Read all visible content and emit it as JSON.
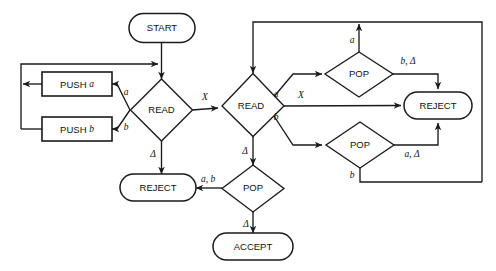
{
  "diagram": {
    "type": "flowchart",
    "background_color": "#ffffff",
    "line_color": "#1a1a1a",
    "text_color": "#111111"
  },
  "nodes": {
    "start": {
      "label": "START",
      "shape": "terminal",
      "cx": 162,
      "cy": 28
    },
    "read_left": {
      "label": "READ",
      "shape": "decision",
      "cx": 161,
      "cy": 110
    },
    "push_a": {
      "label": "PUSH",
      "var": "a",
      "shape": "process",
      "cx": 76,
      "cy": 84
    },
    "push_b": {
      "label": "PUSH",
      "var": "b",
      "shape": "process",
      "cx": 76,
      "cy": 129
    },
    "reject_left": {
      "label": "REJECT",
      "shape": "terminal",
      "cx": 161,
      "cy": 188
    },
    "read_right": {
      "label": "READ",
      "shape": "decision",
      "cx": 253,
      "cy": 105
    },
    "pop_center": {
      "label": "POP",
      "shape": "decision",
      "cx": 253,
      "cy": 188
    },
    "accept": {
      "label": "ACCEPT",
      "shape": "terminal",
      "cx": 253,
      "cy": 246
    },
    "pop_top": {
      "label": "POP",
      "shape": "decision",
      "cx": 359,
      "cy": 74
    },
    "pop_bottom": {
      "label": "POP",
      "shape": "decision",
      "cx": 360,
      "cy": 145
    },
    "reject_right": {
      "label": "REJECT",
      "shape": "terminal",
      "cx": 438,
      "cy": 105
    }
  },
  "edge_labels": {
    "read_left_a": "a",
    "read_left_b": "b",
    "read_left_x": "X",
    "read_left_delta": "Δ",
    "read_right_a": "a",
    "read_right_b": "b",
    "read_right_x": "X",
    "read_right_delta": "Δ",
    "pop_top_a": "a",
    "pop_top_b_delta": "b, Δ",
    "pop_bottom_a_delta": "a, Δ",
    "pop_bottom_b": "b",
    "pop_center_ab": "a, b",
    "pop_center_delta": "Δ"
  }
}
